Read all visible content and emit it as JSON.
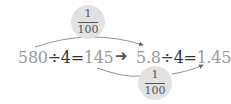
{
  "left_equation": {
    "dividend": "580",
    "op": "÷",
    "divisor": "4",
    "eq": "=",
    "result": "145"
  },
  "right_equation": {
    "dividend": "5.8",
    "op": "÷",
    "divisor": "4",
    "eq": "=",
    "result": "1.45"
  },
  "top_factor": {
    "numerator": "1",
    "denominator": "100"
  },
  "bottom_factor": {
    "numerator": "1",
    "denominator": "100"
  },
  "middle_arrow": "➜",
  "colors": {
    "gray_text": "#9a9a9a",
    "dark_text": "#333333",
    "circle_fill": "#e2e2e2"
  }
}
